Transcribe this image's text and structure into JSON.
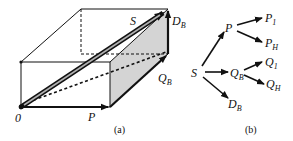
{
  "panel_a": {
    "caption": "(a)",
    "labels": {
      "origin": "0",
      "P": "P",
      "S": "S",
      "Q_B": {
        "main": "Q",
        "sub": "B"
      },
      "D_B": {
        "main": "D",
        "sub": "B"
      }
    },
    "colors": {
      "edge": "#111111",
      "shaded_face": "#d4d4d4",
      "arrow_inner": "#b0b0b0"
    }
  },
  "panel_b": {
    "caption": "(b)",
    "nodes": {
      "S": "S",
      "P": "P",
      "P_1": {
        "main": "P",
        "sub": "1"
      },
      "P_H": {
        "main": "P",
        "sub": "H"
      },
      "Q_B": {
        "main": "Q",
        "sub": "B"
      },
      "Q_1": {
        "main": "Q",
        "sub": "1"
      },
      "Q_H": {
        "main": "Q",
        "sub": "H"
      },
      "D_B": {
        "main": "D",
        "sub": "B"
      }
    },
    "edges": [
      [
        "S",
        "P"
      ],
      [
        "S",
        "Q_B"
      ],
      [
        "S",
        "D_B"
      ],
      [
        "P",
        "P_1"
      ],
      [
        "P",
        "P_H"
      ],
      [
        "Q_B",
        "Q_1"
      ],
      [
        "Q_B",
        "Q_H"
      ]
    ]
  }
}
